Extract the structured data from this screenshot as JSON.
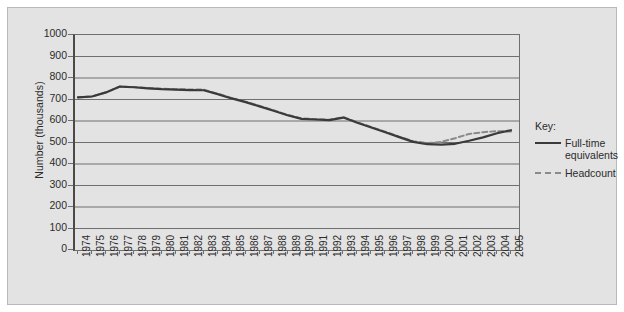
{
  "chart_data": {
    "type": "line",
    "title": "",
    "subtitle": "",
    "xlabel": "",
    "ylabel": "Number (thousands)",
    "ylim": [
      0,
      1000
    ],
    "ytick_step": 100,
    "yticks": [
      "1000",
      "900",
      "800",
      "700",
      "600",
      "500",
      "400",
      "300",
      "200",
      "100",
      "0"
    ],
    "grid": "horizontal",
    "legend_position": "right",
    "legend_title": "Key:",
    "categories": [
      "1974",
      "1975",
      "1976",
      "1977",
      "1978",
      "1979",
      "1980",
      "1981",
      "1982",
      "1983",
      "1984",
      "1985",
      "1986",
      "1987",
      "1988",
      "1989",
      "1990",
      "1991",
      "1992",
      "1993",
      "1994",
      "1995",
      "1996",
      "1997",
      "1998",
      "1999",
      "2000",
      "2001",
      "2002",
      "2003",
      "2004",
      "2005"
    ],
    "series": [
      {
        "name": "Full-time equivalents",
        "style": "solid",
        "color": "#3a3a3a",
        "values": [
          710,
          714,
          733,
          760,
          757,
          752,
          748,
          746,
          744,
          743,
          725,
          705,
          688,
          668,
          648,
          627,
          610,
          607,
          604,
          616,
          592,
          570,
          548,
          525,
          503,
          492,
          490,
          494,
          508,
          524,
          543,
          557
        ]
      },
      {
        "name": "Headcount",
        "style": "dashed",
        "color": "#8a8a8a",
        "values": [
          710,
          714,
          733,
          760,
          758,
          754,
          750,
          748,
          747,
          746,
          727,
          707,
          690,
          670,
          650,
          629,
          612,
          609,
          606,
          618,
          594,
          572,
          550,
          527,
          506,
          497,
          503,
          520,
          540,
          548,
          553,
          551
        ]
      }
    ]
  },
  "legend": {
    "title": "Key:",
    "entries": [
      {
        "label_line1": "Full-time",
        "label_line2": "equivalents",
        "style": "solid"
      },
      {
        "label_line1": "Headcount",
        "label_line2": "",
        "style": "dashed"
      }
    ]
  }
}
